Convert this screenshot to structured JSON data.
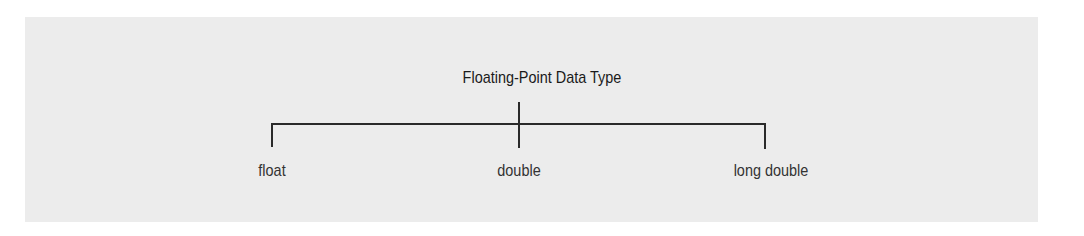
{
  "diagram": {
    "title": "Floating-Point Data Type",
    "children": [
      {
        "label": "float"
      },
      {
        "label": "double"
      },
      {
        "label": "long double"
      }
    ]
  },
  "colors": {
    "panel": "#ececec",
    "lines": "#2a2a2a",
    "text": "#333333"
  }
}
